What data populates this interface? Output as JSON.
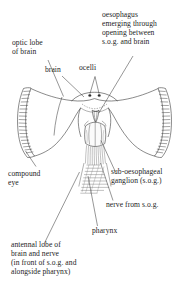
{
  "figure": {
    "background_color": "#ffffff",
    "line_color": "#2b2b2b",
    "text_color": "#242424"
  },
  "labels": {
    "optic_lobe": "optic lobe\nof brain",
    "oesophagus": "oesophagus\nemerging through\nopening between\ns.o.g. and brain",
    "brain": "brain",
    "ocelli": "ocelli",
    "compound_eye": "compound\neye",
    "sub_oesophageal_ganglion": "sub-oesophageal\nganglion (s.o.g.)",
    "nerve_from_sog": "nerve from s.o.g.",
    "pharynx": "pharynx",
    "antennal_lobe": "antennal lobe of\nbrain and nerve\n(in front of s.o.g. and\nalongside pharynx)"
  },
  "structures": [
    {
      "name": "optic-lobe-of-brain",
      "side": "left"
    },
    {
      "name": "compound-eye-left",
      "side": "left"
    },
    {
      "name": "compound-eye-right",
      "side": "right"
    },
    {
      "name": "brain",
      "side": "centre"
    },
    {
      "name": "ocelli",
      "count": 2,
      "side": "centre"
    },
    {
      "name": "oesophagus",
      "side": "centre"
    },
    {
      "name": "sub-oesophageal-ganglion",
      "side": "centre"
    },
    {
      "name": "nerve-from-sog",
      "side": "centre"
    },
    {
      "name": "pharynx",
      "side": "centre"
    },
    {
      "name": "antennal-lobe",
      "side": "centre"
    }
  ]
}
